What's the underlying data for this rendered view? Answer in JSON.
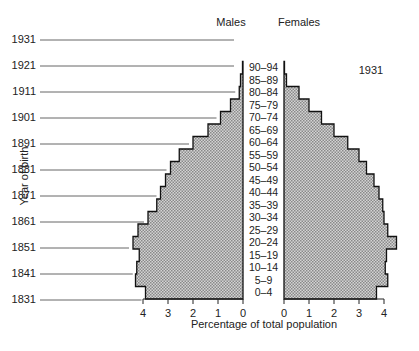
{
  "chart_data": {
    "type": "bar",
    "subtype": "population-pyramid",
    "title": "1931",
    "xlabel": "Percentage of total population",
    "ylabel": "Year of birth",
    "legend": [
      "Males",
      "Females"
    ],
    "categories": [
      "0–4",
      "5–9",
      "10–14",
      "15–19",
      "20–24",
      "25–29",
      "30–34",
      "35–39",
      "40–44",
      "45–49",
      "50–54",
      "55–59",
      "60–64",
      "65–69",
      "70–74",
      "75–79",
      "80–84",
      "85–89",
      "90–94"
    ],
    "series": [
      {
        "name": "Males",
        "values": [
          3.9,
          4.3,
          4.25,
          4.15,
          4.4,
          4.2,
          3.8,
          3.45,
          3.3,
          3.1,
          2.9,
          2.55,
          2.0,
          1.4,
          0.9,
          0.5,
          0.15,
          0.1,
          0.02
        ]
      },
      {
        "name": "Females",
        "values": [
          3.7,
          4.15,
          4.05,
          4.1,
          4.5,
          4.15,
          4.0,
          3.95,
          3.8,
          3.6,
          3.3,
          3.0,
          2.55,
          2.0,
          1.5,
          1.0,
          0.6,
          0.1,
          0.02
        ]
      }
    ],
    "xlim_males": [
      4,
      0
    ],
    "xlim_females": [
      0,
      4
    ],
    "x_ticks_males": [
      "4",
      "3",
      "2",
      "1",
      "0"
    ],
    "x_ticks_females": [
      "0",
      "1",
      "2",
      "3",
      "4"
    ],
    "birth_year_labels": [
      "1831",
      "1841",
      "1851",
      "1861",
      "1871",
      "1881",
      "1891",
      "1901",
      "1911",
      "1921",
      "1931"
    ],
    "grid": false
  },
  "labels": {
    "males": "Males",
    "females": "Females",
    "year": "1931",
    "xlabel": "Percentage of total population",
    "ylabel": "Year of birth"
  },
  "colors": {
    "fill": "#b8b8b8",
    "outline": "#111111",
    "guide_line": "#555555"
  }
}
